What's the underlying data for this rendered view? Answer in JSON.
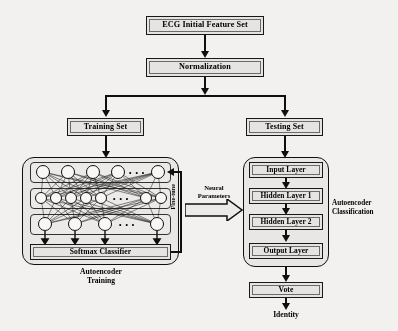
{
  "diagram": {
    "nodes": {
      "ecg_initial_feature_set": "ECG Initial Feature Set",
      "normalization": "Normalization",
      "training_set": "Training Set",
      "testing_set": "Testing Set",
      "softmax_classifier": "Softmax Classifier",
      "input_layer": "Input Layer",
      "hidden_layer_1": "Hidden Layer 1",
      "hidden_layer_2": "Hidden Layer 2",
      "output_layer": "Output Layer",
      "vote": "Vote",
      "identity": "Identity"
    },
    "labels": {
      "autoencoder_training": "Autoencoder\nTraining",
      "autoencoder_training_line1": "Autoencoder",
      "autoencoder_training_line2": "Training",
      "autoencoder_classification_line1": "Autoencoder",
      "autoencoder_classification_line2": "Classification",
      "neural_parameters_line1": "Neural",
      "neural_parameters_line2": "Parameters",
      "fine_tune": "Fine-tune",
      "ellipsis": "• • •"
    },
    "network": {
      "encoder_row_nodes": 5,
      "code_row_nodes": 7,
      "decoder_row_nodes": 4
    },
    "colors": {
      "background": "#f2f1ef",
      "box_fill": "#e3e2e0",
      "panel_fill": "#e6e5e3",
      "stroke": "#111111",
      "node_fill": "#f6f5f3"
    }
  }
}
